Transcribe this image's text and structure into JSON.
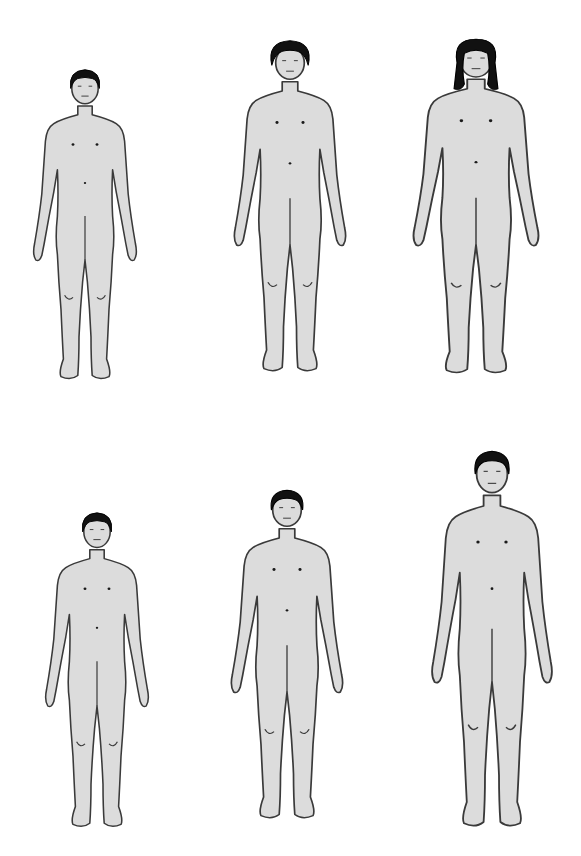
{
  "diagram": {
    "background": "#ffffff",
    "figure_fill": "#dcdcdc",
    "outline_color": "#3a3a3a",
    "hair_color": "#111111",
    "rows": [
      {
        "row": "female",
        "figures": [
          {
            "id": "f1",
            "stage": "early",
            "hair": "short",
            "x": 25,
            "y": 62,
            "w": 120,
            "h": 330
          },
          {
            "id": "f2",
            "stage": "middle",
            "hair": "short-curly",
            "x": 225,
            "y": 35,
            "w": 130,
            "h": 350
          },
          {
            "id": "f3",
            "stage": "late",
            "hair": "long",
            "x": 403,
            "y": 32,
            "w": 146,
            "h": 355
          }
        ]
      },
      {
        "row": "male",
        "figures": [
          {
            "id": "m1",
            "stage": "early",
            "hair": "short",
            "x": 37,
            "y": 505,
            "w": 120,
            "h": 335
          },
          {
            "id": "m2",
            "stage": "middle",
            "hair": "short",
            "x": 222,
            "y": 482,
            "w": 130,
            "h": 350
          },
          {
            "id": "m3",
            "stage": "late",
            "hair": "short",
            "x": 422,
            "y": 442,
            "w": 140,
            "h": 400
          }
        ]
      }
    ]
  }
}
